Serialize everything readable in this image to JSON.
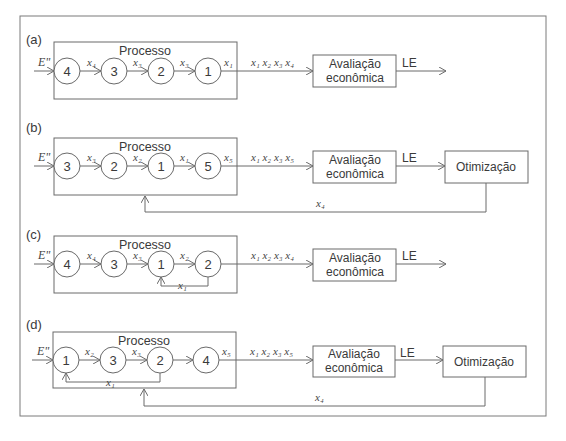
{
  "frame": {
    "border_color": "#7a7a7a"
  },
  "panels": [
    {
      "label": "(a)",
      "process_title": "Processo",
      "input": "E\"",
      "nodes": [
        "4",
        "3",
        "2",
        "1"
      ],
      "edge_labels": [
        "x₄",
        "x₃",
        "x₃",
        "x₁"
      ],
      "output_vars": "x₁ x₂ x₃ x₄",
      "eval_box": [
        "Avaliação",
        "econômica"
      ],
      "le": "LE",
      "optim_box": null,
      "feedback_label": null,
      "internal_recycle": null
    },
    {
      "label": "(b)",
      "process_title": "Processo",
      "input": "E\"",
      "nodes": [
        "3",
        "2",
        "1",
        "5"
      ],
      "edge_labels": [
        "x₃",
        "x₂",
        "x₁",
        "x₅"
      ],
      "output_vars": "x₁ x₂ x₃ x₅",
      "eval_box": [
        "Avaliação",
        "econômica"
      ],
      "le": "LE",
      "optim_box": "Otimização",
      "feedback_label": "x₄",
      "internal_recycle": null
    },
    {
      "label": "(c)",
      "process_title": "Processo",
      "input": "E\"",
      "nodes": [
        "4",
        "3",
        "1",
        "2"
      ],
      "edge_labels": [
        "x₄",
        "x₃",
        "x₂",
        ""
      ],
      "output_vars": "x₁ x₂ x₃ x₄",
      "eval_box": [
        "Avaliação",
        "econômica"
      ],
      "le": "LE",
      "optim_box": null,
      "feedback_label": null,
      "internal_recycle": {
        "label": "x₁",
        "from": "2",
        "to": "1"
      }
    },
    {
      "label": "(d)",
      "process_title": "Processo",
      "input": "E\"",
      "nodes": [
        "1",
        "3",
        "2",
        "4"
      ],
      "edge_labels": [
        "x₂",
        "x₃",
        "",
        "x₅"
      ],
      "output_vars": "x₁ x₂ x₃ x₅",
      "eval_box": [
        "Avaliação",
        "econômica"
      ],
      "le": "LE",
      "optim_box": "Otimização",
      "feedback_label": "x₄",
      "internal_recycle": {
        "label": "x₁",
        "from": "2",
        "to": "1"
      }
    }
  ]
}
